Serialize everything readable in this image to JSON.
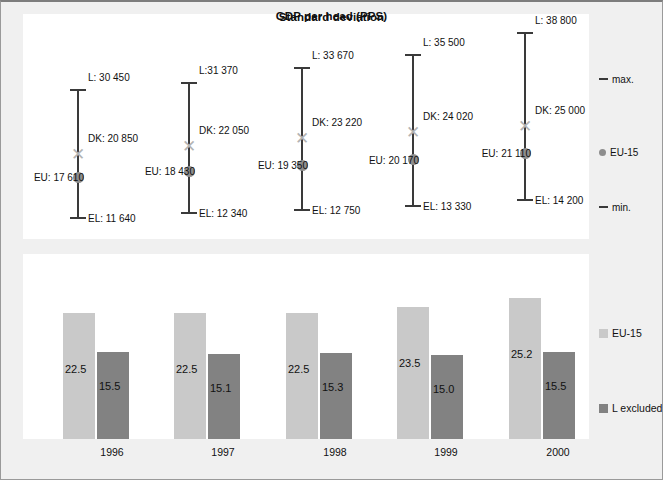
{
  "figure": {
    "background": "#f0f0f0",
    "panel_background": "#ffffff",
    "border_color": "#9a9a9a"
  },
  "top_chart": {
    "title": "GDP per head (PPS)",
    "legend": {
      "max_label": "max.",
      "eu_label": "EU-15",
      "min_label": "min."
    }
  },
  "bottom_chart": {
    "title": "Standard deviation",
    "legend": {
      "series_a": "EU-15",
      "series_b": "L excluded"
    }
  },
  "chart_data": [
    {
      "type": "range",
      "title": "GDP per head (PPS)",
      "xlabel": "",
      "ylabel": "",
      "categories": [
        "1996",
        "1997",
        "1998",
        "1999",
        "2000"
      ],
      "legend": [
        "max.",
        "EU-15",
        "min."
      ],
      "legend_position": "right",
      "grid": false,
      "ylim": [
        10000,
        40000
      ],
      "points": [
        {
          "category": "1996",
          "max_label": "L: 30 450",
          "max_value": 30450,
          "dk_label": "DK: 20 850",
          "dk_value": 20850,
          "eu_label": "EU: 17 610",
          "eu_value": 17610,
          "min_label": "EL: 11 640",
          "min_value": 11640
        },
        {
          "category": "1997",
          "max_label": "L:31 370",
          "max_value": 31370,
          "dk_label": "DK: 22 050",
          "dk_value": 22050,
          "eu_label": "EU: 18 430",
          "eu_value": 18430,
          "min_label": "EL: 12 340",
          "min_value": 12340
        },
        {
          "category": "1998",
          "max_label": "L: 33 670",
          "max_value": 33670,
          "dk_label": "DK: 23 220",
          "dk_value": 23220,
          "eu_label": "EU: 19 350",
          "eu_value": 19350,
          "min_label": "EL: 12 750",
          "min_value": 12750
        },
        {
          "category": "1999",
          "max_label": "L: 35 500",
          "max_value": 35500,
          "dk_label": "DK: 24 020",
          "dk_value": 24020,
          "eu_label": "EU: 20 170",
          "eu_value": 20170,
          "min_label": "EL: 13 330",
          "min_value": 13330
        },
        {
          "category": "2000",
          "max_label": "L: 38 800",
          "max_value": 38800,
          "dk_label": "DK: 25 000",
          "dk_value": 25000,
          "eu_label": "EU: 21 110",
          "eu_value": 21110,
          "min_label": "EL: 14 200",
          "min_value": 14200
        }
      ]
    },
    {
      "type": "bar",
      "title": "Standard deviation",
      "xlabel": "",
      "ylabel": "",
      "categories": [
        "1996",
        "1997",
        "1998",
        "1999",
        "2000"
      ],
      "grid": false,
      "legend_position": "right",
      "ylim": [
        0,
        28
      ],
      "series": [
        {
          "name": "EU-15",
          "color": "#c9c9c9",
          "values": [
            22.5,
            22.5,
            22.5,
            23.5,
            25.2
          ],
          "labels": [
            "22.5",
            "22.5",
            "22.5",
            "23.5",
            "25.2"
          ]
        },
        {
          "name": "L excluded",
          "color": "#828282",
          "values": [
            15.5,
            15.1,
            15.3,
            15.0,
            15.5
          ],
          "labels": [
            "15.5",
            "15.1",
            "15.3",
            "15.0",
            "15.5"
          ]
        }
      ]
    }
  ]
}
